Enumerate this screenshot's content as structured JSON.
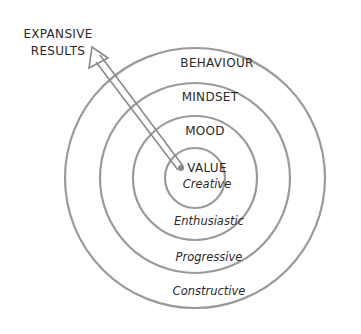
{
  "diagram": {
    "annotation": {
      "line1": "EXPANSIVE",
      "line2": "RESULTS"
    },
    "rings": [
      {
        "name": "value",
        "title": "VALUE",
        "subtitle": "Creative"
      },
      {
        "name": "mood",
        "title": "MOOD",
        "subtitle": "Enthusiastic"
      },
      {
        "name": "mindset",
        "title": "MINDSET",
        "subtitle": "Progressive"
      },
      {
        "name": "behaviour",
        "title": "BEHAVIOUR",
        "subtitle": "Constructive"
      }
    ],
    "colors": {
      "ring_stroke": "#9a9a9a",
      "text": "#2a2a2a",
      "background": "#ffffff"
    }
  }
}
